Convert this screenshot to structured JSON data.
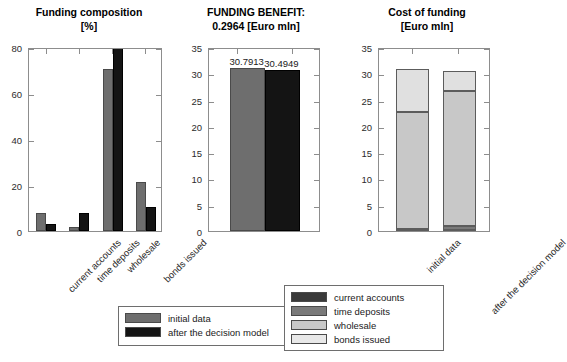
{
  "chart_data": [
    {
      "type": "bar",
      "id": "funding-composition",
      "title": "Funding composition",
      "subtitle": "[%]",
      "xlabel": "",
      "ylabel": "",
      "ylim": [
        0,
        80
      ],
      "yticks": [
        0,
        20,
        40,
        60,
        80
      ],
      "grid": false,
      "categories": [
        "current accounts",
        "time deposits",
        "wholesale",
        "bonds issued"
      ],
      "series": [
        {
          "name": "initial data",
          "color": "#6e6e6e",
          "values": [
            7.3,
            1.4,
            70.0,
            20.7
          ]
        },
        {
          "name": "after the decision model",
          "color": "#141414",
          "values": [
            2.6,
            7.6,
            84.0,
            10.0
          ]
        }
      ],
      "notes": "black wholesale bar is clipped at the top of the axis"
    },
    {
      "type": "bar",
      "id": "funding-benefit",
      "title": "FUNDING BENEFIT:",
      "subtitle": "0.2964 [Euro mln]",
      "xlabel": "",
      "ylabel": "",
      "ylim": [
        0,
        35
      ],
      "yticks": [
        0,
        5,
        10,
        15,
        20,
        25,
        30,
        35
      ],
      "grid": false,
      "categories": [
        "initial data",
        "after the decision model"
      ],
      "values": [
        30.7913,
        30.4949
      ],
      "value_labels": [
        "30.7913",
        "30.4949"
      ],
      "colors": [
        "#6e6e6e",
        "#141414"
      ]
    },
    {
      "type": "bar",
      "id": "cost-of-funding",
      "subtype": "stacked",
      "title": "Cost of funding",
      "subtitle": "[Euro mln]",
      "xlabel": "",
      "ylabel": "",
      "ylim": [
        0,
        35
      ],
      "yticks": [
        0,
        5,
        10,
        15,
        20,
        25,
        30,
        35
      ],
      "grid": false,
      "categories": [
        "initial data",
        "after the decision model"
      ],
      "stack_order": [
        "current accounts",
        "time deposits",
        "wholesale",
        "bonds issued"
      ],
      "series": [
        {
          "name": "current accounts",
          "color": "#3a3a3a",
          "values": [
            0.12,
            0.22
          ]
        },
        {
          "name": "time deposits",
          "color": "#7a7a7a",
          "values": [
            0.18,
            0.68
          ]
        },
        {
          "name": "wholesale",
          "color": "#c8c8c8",
          "values": [
            22.4,
            25.8
          ]
        },
        {
          "name": "bonds issued",
          "color": "#e0e0e0",
          "values": [
            8.1,
            3.8
          ]
        }
      ],
      "totals": [
        30.8,
        30.5
      ]
    }
  ],
  "charts": {
    "composition": {
      "title": "Funding composition",
      "subtitle": "[%]",
      "yticks": [
        "0",
        "20",
        "40",
        "60",
        "80"
      ],
      "xlabels": [
        "current accounts",
        "time deposits",
        "wholesale",
        "bonds issued"
      ]
    },
    "benefit": {
      "title": "FUNDING BENEFIT:",
      "subtitle": "0.2964 [Euro mln]",
      "yticks": [
        "0",
        "5",
        "10",
        "15",
        "20",
        "25",
        "30",
        "35"
      ],
      "bar_labels": [
        "30.7913",
        "30.4949"
      ]
    },
    "cost": {
      "title": "Cost of funding",
      "subtitle": "[Euro mln]",
      "yticks": [
        "0",
        "5",
        "10",
        "15",
        "20",
        "25",
        "30",
        "35"
      ],
      "xlabels": [
        "initial data",
        "after the decision model"
      ]
    }
  },
  "legend_scenarios": {
    "items": [
      {
        "label": "initial data",
        "color": "#6e6e6e"
      },
      {
        "label": "after the decision model",
        "color": "#141414"
      }
    ]
  },
  "legend_components": {
    "items": [
      {
        "label": "current accounts",
        "color": "#3a3a3a"
      },
      {
        "label": "time deposits",
        "color": "#7a7a7a"
      },
      {
        "label": "wholesale",
        "color": "#c8c8c8"
      },
      {
        "label": "bonds issued",
        "color": "#e0e0e0"
      }
    ]
  }
}
